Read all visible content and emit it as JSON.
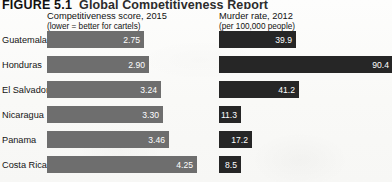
{
  "figure": {
    "number": "FIGURE 5.1",
    "title": "Global Competitiveness Report"
  },
  "headers": {
    "left": {
      "line1": "Competitiveness score, 2015",
      "line2": "(lower = better for cartels)"
    },
    "right": {
      "line1": "Murder rate, 2012",
      "line2": "(per 100,000 people)"
    }
  },
  "colors": {
    "background": "#fbfbfa",
    "competitiveness_bar": "#6e6e6e",
    "murder_bar": "#262626",
    "value_text": "#ffffff",
    "label_text": "#141414"
  },
  "chart_data": {
    "type": "bar",
    "title": "Global Competitiveness Report",
    "orientation": "horizontal",
    "grid": false,
    "legend": "none",
    "categories": [
      "Guatemala",
      "Honduras",
      "El Salvador",
      "Nicaragua",
      "Panama",
      "Costa Rica"
    ],
    "series": [
      {
        "name": "Competitiveness score, 2015",
        "sublabel": "(lower = better for cartels)",
        "units": "score",
        "values": [
          2.75,
          2.9,
          3.24,
          3.3,
          3.46,
          4.25
        ],
        "labels": [
          "2.75",
          "2.90",
          "3.24",
          "3.30",
          "3.46",
          "4.25"
        ],
        "axis_start": 0,
        "axis_max": 4.6
      },
      {
        "name": "Murder rate, 2012",
        "sublabel": "(per 100,000 people)",
        "units": "per 100,000 people",
        "values": [
          39.9,
          90.4,
          41.2,
          11.3,
          17.2,
          8.5
        ],
        "labels": [
          "39.9",
          "90.4",
          "41.2",
          "11.3",
          "17.2",
          "8.5"
        ],
        "axis_start": 0,
        "axis_max": 95
      }
    ],
    "xlabel": "",
    "ylabel": ""
  },
  "geometry": {
    "left_bar_origin": 47,
    "left_bar_scale": 35.3,
    "right_bar_origin": 219,
    "right_bar_scale": 1.93,
    "row_top_start": 31,
    "row_pitch": 25,
    "row_height": 17
  }
}
